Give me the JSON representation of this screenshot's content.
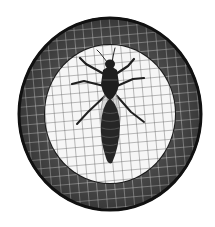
{
  "image": {
    "subject": "mosquito-emblem",
    "description": "Insect (mosquito) illustration on a grid screen inside a circular emblem with a dark meshed ring",
    "colors": {
      "background": "#ffffff",
      "ring_fill": "#4a4a4a",
      "ring_border": "#111111",
      "ring_grid": "#d8d8d8",
      "inner_fill": "#f6f6f6",
      "inner_grid": "#555555",
      "insect": "#1e1e1e",
      "wing": "#9a9a9a"
    },
    "geometry": {
      "center_x": 110,
      "center_y": 114,
      "outer_rx": 92,
      "outer_ry": 97,
      "inner_rx": 65,
      "inner_ry": 69,
      "grid_spacing": 9,
      "grid_rotation_deg": -5
    }
  }
}
